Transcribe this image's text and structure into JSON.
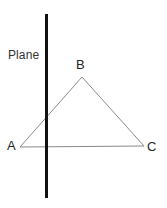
{
  "figure": {
    "width": 167,
    "height": 208,
    "background_color": "#ffffff"
  },
  "labels": {
    "plane": "Plane",
    "vertex_a": "A",
    "vertex_b": "B",
    "vertex_c": "C"
  },
  "chart_data": {
    "type": "diagram",
    "background_color": "#ffffff",
    "shapes": [
      {
        "name": "plane-line",
        "type": "line",
        "label": "Plane",
        "color": "#111111",
        "stroke_width": 3,
        "x1": 46.5,
        "y1": 14,
        "x2": 46.5,
        "y2": 198
      },
      {
        "name": "triangle-abc",
        "type": "polygon",
        "color": "#8a8a8a",
        "stroke_width": 1,
        "fill": "none",
        "points": [
          {
            "label": "A",
            "x": 20,
            "y": 147
          },
          {
            "label": "B",
            "x": 82,
            "y": 77
          },
          {
            "label": "C",
            "x": 144,
            "y": 146
          }
        ]
      }
    ],
    "annotations": [
      {
        "text": "Plane",
        "x": 8,
        "y": 49,
        "anchor": "start"
      },
      {
        "text": "A",
        "x": 12,
        "y": 147,
        "anchor": "middle"
      },
      {
        "text": "B",
        "x": 81,
        "y": 65,
        "anchor": "middle"
      },
      {
        "text": "C",
        "x": 152,
        "y": 147,
        "anchor": "middle"
      }
    ]
  }
}
